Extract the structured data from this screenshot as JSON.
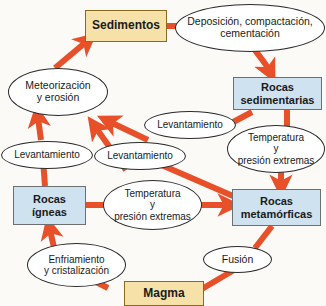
{
  "diagram": {
    "background_color": "#fbfaf7",
    "arrow_color": "#e8502a",
    "colors": {
      "sediment_fill": "#f6e2a8",
      "sediment_border": "#8a6a1e",
      "rock_fill": "#cfe2ef",
      "rock_border": "#6d6f72",
      "ellipse_fill": "#ffffff",
      "ellipse_border": "#2b2b2b",
      "text": "#1a1a1a"
    }
  },
  "nodes": {
    "sedimentos": {
      "label": "Sedimentos",
      "shape": "box",
      "kind": "material"
    },
    "deposicion": {
      "label": "Deposición, compactación,\ncementación",
      "shape": "ellipse",
      "kind": "process"
    },
    "rocas_sedimentarias": {
      "label": "Rocas\nsedimentarias",
      "shape": "box",
      "kind": "rock"
    },
    "meteorizacion": {
      "label": "Meteorización\ny erosión",
      "shape": "ellipse",
      "kind": "process"
    },
    "levantamiento_izq": {
      "label": "Levantamiento",
      "shape": "ellipse",
      "kind": "process"
    },
    "levantamiento_centro": {
      "label": "Levantamiento",
      "shape": "ellipse",
      "kind": "process"
    },
    "levantamiento_der": {
      "label": "Levantamiento",
      "shape": "ellipse",
      "kind": "process"
    },
    "temp_presion_der": {
      "label": "Temperatura\ny\npresión extremas",
      "shape": "ellipse",
      "kind": "process"
    },
    "rocas_igneas": {
      "label": "Rocas\nígneas",
      "shape": "box",
      "kind": "rock"
    },
    "temp_presion_centro": {
      "label": "Temperatura\ny\npresión extremas",
      "shape": "ellipse",
      "kind": "process"
    },
    "rocas_metamorficas": {
      "label": "Rocas\nmetamórficas",
      "shape": "box",
      "kind": "rock"
    },
    "enfriamiento": {
      "label": "Enfriamiento\ny cristalización",
      "shape": "ellipse",
      "kind": "process"
    },
    "fusion": {
      "label": "Fusión",
      "shape": "ellipse",
      "kind": "process"
    },
    "magma": {
      "label": "Magma",
      "shape": "box",
      "kind": "material"
    }
  },
  "edges": [
    {
      "from": "sedimentos",
      "to": "deposicion",
      "label": "",
      "arrowhead": false
    },
    {
      "from": "deposicion",
      "to": "rocas_sedimentarias",
      "label": "",
      "arrowhead": true
    },
    {
      "from": "rocas_sedimentarias",
      "to": "temp_presion_der",
      "label": "",
      "arrowhead": false
    },
    {
      "from": "temp_presion_der",
      "to": "rocas_metamorficas",
      "label": "",
      "arrowhead": true
    },
    {
      "from": "rocas_metamorficas",
      "to": "fusion",
      "label": "",
      "arrowhead": false
    },
    {
      "from": "fusion",
      "to": "magma",
      "label": "",
      "arrowhead": true
    },
    {
      "from": "magma",
      "to": "enfriamiento",
      "label": "",
      "arrowhead": false
    },
    {
      "from": "enfriamiento",
      "to": "rocas_igneas",
      "label": "",
      "arrowhead": true
    },
    {
      "from": "rocas_igneas",
      "to": "temp_presion_centro",
      "label": "",
      "arrowhead": false
    },
    {
      "from": "temp_presion_centro",
      "to": "rocas_metamorficas",
      "label": "",
      "arrowhead": true
    },
    {
      "from": "rocas_igneas",
      "to": "levantamiento_izq",
      "label": "",
      "arrowhead": false
    },
    {
      "from": "levantamiento_izq",
      "to": "meteorizacion",
      "label": "",
      "arrowhead": true
    },
    {
      "from": "levantamiento_centro",
      "to": "meteorizacion",
      "label": "",
      "arrowhead": true
    },
    {
      "from": "levantamiento_der",
      "to": "meteorizacion",
      "label": "",
      "arrowhead": true
    },
    {
      "from": "rocas_sedimentarias",
      "to": "levantamiento_der",
      "label": "",
      "arrowhead": false
    },
    {
      "from": "rocas_metamorficas",
      "to": "levantamiento_centro",
      "label": "",
      "arrowhead": false
    },
    {
      "from": "meteorizacion",
      "to": "sedimentos",
      "label": "",
      "arrowhead": true
    }
  ]
}
